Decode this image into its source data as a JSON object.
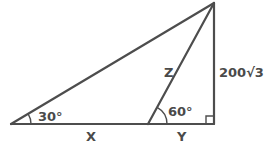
{
  "diagram": {
    "type": "right-triangle-geometry",
    "vertices": {
      "left": {
        "x": 11,
        "y": 124
      },
      "inner": {
        "x": 148,
        "y": 124
      },
      "right_angle": {
        "x": 214,
        "y": 124
      },
      "top": {
        "x": 214,
        "y": 3
      }
    },
    "labels": {
      "angle_left": "30°",
      "angle_inner": "60°",
      "segment_x": "X",
      "segment_y": "Y",
      "segment_z": "Z",
      "height": "200√3"
    },
    "colors": {
      "line": "#4d4d4d",
      "text": "#4a4a4a",
      "background": "#ffffff"
    }
  }
}
